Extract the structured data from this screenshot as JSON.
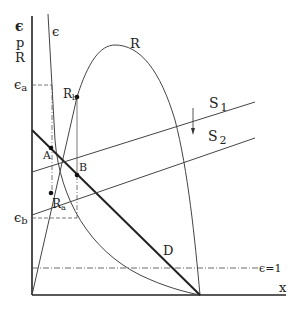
{
  "diagram": {
    "axis_labels": {
      "y_line1": "є",
      "y_line2": "p",
      "y_line3": "R",
      "x": "x"
    },
    "curve_labels": {
      "elasticity": "є",
      "revenue": "R",
      "demand": "D",
      "supply1": "S",
      "supply1_sub": "1",
      "supply2": "S",
      "supply2_sub": "2",
      "unit_elastic": "є=1"
    },
    "point_labels": {
      "A": "A",
      "B": "B",
      "Ra": "R",
      "Ra_sub": "a",
      "Rb": "R",
      "Rb_sub": "b"
    },
    "level_labels": {
      "eps_a": "є",
      "eps_a_sub": "a",
      "eps_b": "є",
      "eps_b_sub": "b"
    },
    "colors": {
      "ink": "#222222",
      "thin": "#555555"
    }
  }
}
